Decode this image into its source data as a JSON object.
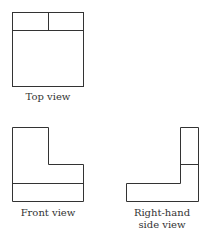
{
  "views": {
    "top": {
      "label": "Top view"
    },
    "front": {
      "label": "Front view"
    },
    "side": {
      "label_line1": "Right-hand",
      "label_line2": "side view"
    }
  },
  "colors": {
    "stroke": "#333333",
    "background": "#ffffff"
  }
}
